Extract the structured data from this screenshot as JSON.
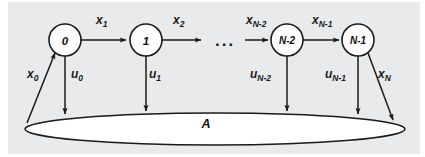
{
  "figure": {
    "type": "state-transition-diagram",
    "background_color": "#e6e8ea",
    "page_color": "#ffffff",
    "stroke_color": "#1a1a1a",
    "node_fill": "#ffffff",
    "set_fill": "#ffffff"
  },
  "nodes": [
    {
      "id": "n0",
      "label": "0",
      "cx": 65,
      "cy": 40,
      "r": 16
    },
    {
      "id": "n1",
      "label": "1",
      "cx": 146,
      "cy": 40,
      "r": 16
    },
    {
      "id": "nN2",
      "label": "N-2",
      "cx": 287,
      "cy": 40,
      "r": 16
    },
    {
      "id": "nN1",
      "label": "N-1",
      "cx": 358,
      "cy": 40,
      "r": 16
    }
  ],
  "ellipsis": {
    "label": "...",
    "x": 227,
    "y": 42
  },
  "set": {
    "label": "A",
    "cx": 215,
    "cy": 129,
    "rx": 190,
    "ry": 16,
    "label_x": 206,
    "label_y": 128
  },
  "transition_labels": [
    {
      "id": "x1",
      "base": "x",
      "sub": "1",
      "x": 96,
      "y": 24
    },
    {
      "id": "x2",
      "base": "x",
      "sub": "2",
      "x": 173,
      "y": 24
    },
    {
      "id": "xN2",
      "base": "x",
      "sub": "N-2",
      "x": 246,
      "y": 24
    },
    {
      "id": "xN1",
      "base": "x",
      "sub": "N-1",
      "x": 312,
      "y": 24
    }
  ],
  "input_labels": [
    {
      "id": "x0",
      "base": "x",
      "sub": "0",
      "x": 28,
      "y": 78
    },
    {
      "id": "u0",
      "base": "u",
      "sub": "0",
      "x": 71,
      "y": 78
    },
    {
      "id": "u1",
      "base": "u",
      "sub": "1",
      "x": 149,
      "y": 78
    },
    {
      "id": "uN2",
      "base": "u",
      "sub": "N-2",
      "x": 252,
      "y": 78
    },
    {
      "id": "uN1",
      "base": "u",
      "sub": "N-1",
      "x": 327,
      "y": 78
    },
    {
      "id": "xN",
      "base": "x",
      "sub": "N",
      "x": 379,
      "y": 78
    }
  ],
  "arrows": {
    "horizontal": [
      {
        "id": "arrow-0-to-1",
        "x1": 81,
        "y1": 40,
        "x2": 128,
        "y2": 40
      },
      {
        "id": "arrow-1-to-right",
        "x1": 162,
        "y1": 40,
        "x2": 202,
        "y2": 40
      },
      {
        "id": "arrow-dots-to-N2",
        "x1": 245,
        "y1": 40,
        "x2": 269,
        "y2": 40
      },
      {
        "id": "arrow-N2-to-N1",
        "x1": 303,
        "y1": 40,
        "x2": 340,
        "y2": 40
      }
    ],
    "vertical": [
      {
        "id": "arrow-u0-down",
        "x1": 65,
        "y1": 56,
        "x2": 65,
        "y2": 116
      },
      {
        "id": "arrow-u1-down",
        "x1": 146,
        "y1": 56,
        "x2": 146,
        "y2": 113
      },
      {
        "id": "arrow-uN2-down",
        "x1": 287,
        "y1": 56,
        "x2": 287,
        "y2": 113
      },
      {
        "id": "arrow-uN1-down",
        "x1": 358,
        "y1": 56,
        "x2": 358,
        "y2": 116
      }
    ],
    "diagonal": [
      {
        "id": "arrow-x0-up",
        "x1": 27,
        "y1": 123,
        "x2": 56,
        "y2": 52
      },
      {
        "id": "arrow-xN-down",
        "x1": 368,
        "y1": 53,
        "x2": 394,
        "y2": 122
      }
    ]
  }
}
